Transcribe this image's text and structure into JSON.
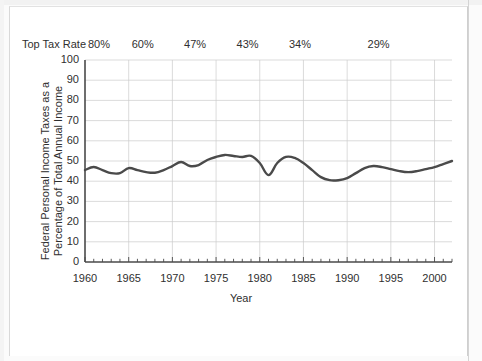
{
  "chart_data": {
    "type": "line",
    "title": "",
    "xlabel": "Year",
    "ylabel_line1": "Federal Personal Income Taxes as a",
    "ylabel_line2": "Percentage of Total Annual Income",
    "ylabel": "Federal Personal Income Taxes as a Percentage of Total Annual Income",
    "xlim": [
      1960,
      2002
    ],
    "ylim": [
      0,
      100
    ],
    "grid": true,
    "legend": "none",
    "yticks": [
      0,
      10,
      20,
      30,
      40,
      50,
      60,
      70,
      80,
      90,
      100
    ],
    "ytick_labels": [
      "0",
      "10",
      "20",
      "30",
      "40",
      "50",
      "60",
      "70",
      "80",
      "90",
      "100"
    ],
    "xticks": [
      1960,
      1965,
      1970,
      1975,
      1980,
      1985,
      1990,
      1995,
      2000
    ],
    "xtick_labels": [
      "1960",
      "1965",
      "1970",
      "1975",
      "1980",
      "1985",
      "1990",
      "1995",
      "2000"
    ],
    "x_minor_tick_interval": 1,
    "line_color": "#4a4a4a",
    "grid_color": "#cccccc",
    "axis_color": "#4a4a4a",
    "x": [
      1960,
      1961,
      1962,
      1963,
      1964,
      1965,
      1966,
      1967,
      1968,
      1969,
      1970,
      1971,
      1972,
      1973,
      1974,
      1975,
      1976,
      1977,
      1978,
      1979,
      1980,
      1981,
      1982,
      1983,
      1984,
      1985,
      1986,
      1987,
      1988,
      1989,
      1990,
      1991,
      1992,
      1993,
      1994,
      1995,
      1996,
      1997,
      1998,
      1999,
      2000,
      2001,
      2002
    ],
    "values": [
      45.5,
      47.0,
      45.5,
      44.0,
      44.0,
      46.5,
      45.5,
      44.5,
      44.2,
      45.5,
      47.5,
      49.5,
      47.5,
      48.0,
      50.5,
      52.0,
      53.0,
      52.5,
      52.0,
      52.5,
      49.0,
      43.0,
      49.0,
      52.0,
      51.5,
      49.0,
      45.5,
      42.0,
      40.5,
      40.5,
      41.5,
      44.0,
      46.5,
      47.5,
      47.0,
      46.0,
      45.0,
      44.5,
      45.0,
      46.0,
      47.0,
      48.5,
      50.0
    ],
    "series": [
      {
        "name": "Federal Personal Income Taxes as a Percentage of Total Annual Income",
        "values": [
          45.5,
          47.0,
          45.5,
          44.0,
          44.0,
          46.5,
          45.5,
          44.5,
          44.2,
          45.5,
          47.5,
          49.5,
          47.5,
          48.0,
          50.5,
          52.0,
          53.0,
          52.5,
          52.0,
          52.5,
          49.0,
          43.0,
          49.0,
          52.0,
          51.5,
          49.0,
          45.5,
          42.0,
          40.5,
          40.5,
          41.5,
          44.0,
          46.5,
          47.5,
          47.0,
          46.0,
          45.0,
          44.5,
          45.0,
          46.0,
          47.0,
          48.5,
          50.0
        ]
      }
    ],
    "annotations": {
      "label": "Top Tax Rate",
      "marks": [
        {
          "text": "80%",
          "year": 1960
        },
        {
          "text": "60%",
          "year": 1965
        },
        {
          "text": "47%",
          "year": 1971
        },
        {
          "text": "43%",
          "year": 1977
        },
        {
          "text": "34%",
          "year": 1983
        },
        {
          "text": "29%",
          "year": 1992
        }
      ]
    }
  }
}
